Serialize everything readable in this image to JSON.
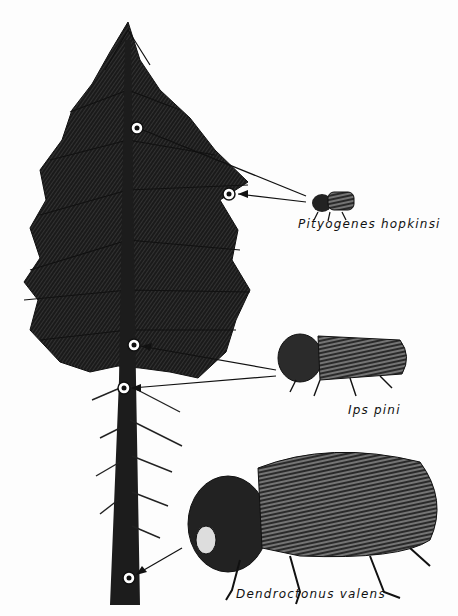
{
  "figure": {
    "colors": {
      "ink": "#111111",
      "paper": "#fdfdfd"
    }
  },
  "species": [
    {
      "name": "Pityogenes hopkinsi",
      "attack_zone": "upper crown branches",
      "markers": 2
    },
    {
      "name": "Ips pini",
      "attack_zone": "lower crown / upper bole",
      "markers": 2
    },
    {
      "name": "Dendroctonus valens",
      "attack_zone": "base of trunk",
      "markers": 1
    }
  ],
  "labels": {
    "pityogenes": "Pityogenes hopkinsi",
    "ips": "Ips pini",
    "dendroctonus": "Dendroctonus valens"
  }
}
